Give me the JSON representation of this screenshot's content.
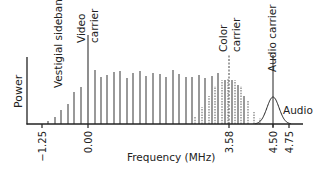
{
  "diagram": {
    "y_axis_label": "Power",
    "x_axis_label": "Frequency (MHz)",
    "ticks": [
      {
        "label": "−1.25",
        "value": -1.25,
        "x": 42
      },
      {
        "label": "0.00",
        "value": 0.0,
        "x": 88
      },
      {
        "label": "3.58",
        "value": 3.58,
        "x": 229
      },
      {
        "label": "4.50",
        "value": 4.5,
        "x": 273
      },
      {
        "label": "4.75",
        "value": 4.75,
        "x": 289
      }
    ],
    "annotations": {
      "vestigial": "Vestigial sidebands",
      "video_line1": "Video",
      "video_line2": "carrier",
      "color_line1": "Color",
      "color_line2": "carrier",
      "audio_carrier": "Audio carrier",
      "audio": "Audio"
    },
    "colors": {
      "axis": "#222222",
      "line": "#555555",
      "dashed": "#777777",
      "text": "#222222"
    },
    "video_carrier": {
      "x": 88,
      "top": 35
    },
    "color_carrier": {
      "x": 229,
      "top": 55
    },
    "audio_carrier": {
      "x": 273,
      "top": 55,
      "peak": 97,
      "sigma": 6
    },
    "baseline_y": 124,
    "solid_lines": [
      {
        "x": 48,
        "top": 121
      },
      {
        "x": 55,
        "top": 117
      },
      {
        "x": 61,
        "top": 110
      },
      {
        "x": 68,
        "top": 104
      },
      {
        "x": 74,
        "top": 92
      },
      {
        "x": 81,
        "top": 87
      },
      {
        "x": 95,
        "top": 70
      },
      {
        "x": 101,
        "top": 77
      },
      {
        "x": 107,
        "top": 75
      },
      {
        "x": 114,
        "top": 72
      },
      {
        "x": 120,
        "top": 71
      },
      {
        "x": 127,
        "top": 78
      },
      {
        "x": 133,
        "top": 73
      },
      {
        "x": 140,
        "top": 71
      },
      {
        "x": 146,
        "top": 76
      },
      {
        "x": 153,
        "top": 73
      },
      {
        "x": 160,
        "top": 74
      },
      {
        "x": 166,
        "top": 77
      },
      {
        "x": 173,
        "top": 70
      },
      {
        "x": 179,
        "top": 74
      },
      {
        "x": 186,
        "top": 77
      },
      {
        "x": 192,
        "top": 77
      },
      {
        "x": 199,
        "top": 75
      },
      {
        "x": 205,
        "top": 78
      },
      {
        "x": 212,
        "top": 76
      },
      {
        "x": 218,
        "top": 73
      },
      {
        "x": 225,
        "top": 80
      },
      {
        "x": 232,
        "top": 80
      },
      {
        "x": 238,
        "top": 85
      },
      {
        "x": 244,
        "top": 96
      }
    ],
    "dashed_lines": [
      {
        "x": 195,
        "top": 117
      },
      {
        "x": 202,
        "top": 107
      },
      {
        "x": 209,
        "top": 96
      },
      {
        "x": 215,
        "top": 86
      },
      {
        "x": 222,
        "top": 80
      },
      {
        "x": 228,
        "top": 79
      },
      {
        "x": 235,
        "top": 80
      },
      {
        "x": 241,
        "top": 86
      },
      {
        "x": 248,
        "top": 100
      },
      {
        "x": 254,
        "top": 112
      },
      {
        "x": 260,
        "top": 118
      }
    ]
  }
}
